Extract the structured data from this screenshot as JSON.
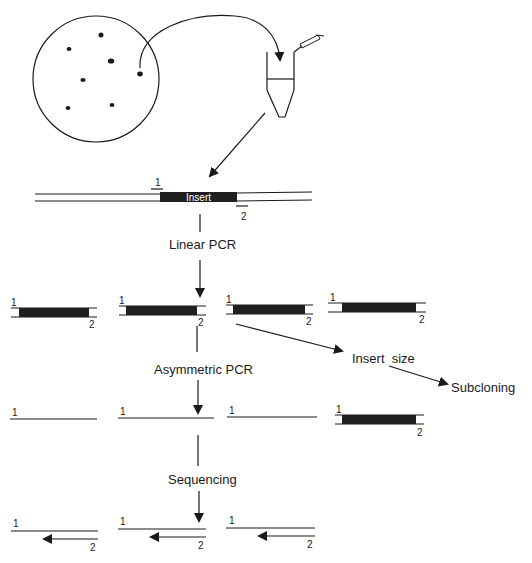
{
  "diagram": {
    "title": "",
    "colors": {
      "ink": "#1a1a1a",
      "insert_fill": "#1f1f1f",
      "background": "#ffffff"
    },
    "plate": {
      "label": "",
      "colonies": 7
    },
    "tube": {
      "label": ""
    },
    "vector": {
      "insert_label": "Insert",
      "primer1_label": "1",
      "primer2_label": "2"
    },
    "steps": {
      "linear_pcr": "Linear PCR",
      "asymmetric_pcr": "Asymmetric PCR",
      "sequencing": "Sequencing",
      "insert_size": "Insert  size",
      "subcloning": "Subcloning"
    },
    "row_labels": {
      "p1": "1",
      "p2": "2"
    },
    "rows": {
      "linear_pcr_products": 4,
      "asymmetric_pcr_products": 4,
      "sequencing_products": 3
    }
  }
}
